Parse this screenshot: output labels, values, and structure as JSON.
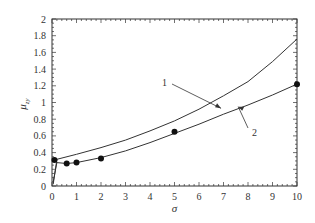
{
  "chart_data": {
    "type": "line",
    "title": "",
    "xlabel": "σ",
    "ylabel": "μ",
    "ylabel_sub": "zy",
    "xlim": [
      0,
      10
    ],
    "ylim": [
      0,
      2
    ],
    "grid": false,
    "x_ticks": [
      "0",
      "1",
      "2",
      "3",
      "4",
      "5",
      "6",
      "7",
      "8",
      "9",
      "10"
    ],
    "y_ticks": [
      "0",
      "0.2",
      "0.4",
      "0.6",
      "0.8",
      "1",
      "1.2",
      "1.4",
      "1.6",
      "1.8",
      "2"
    ],
    "series": [
      {
        "name": "1",
        "style": "line",
        "x": [
          0.05,
          0.2,
          1,
          2,
          3,
          4,
          5,
          6,
          7,
          8,
          9,
          10
        ],
        "values": [
          0.02,
          0.32,
          0.38,
          0.46,
          0.55,
          0.66,
          0.78,
          0.92,
          1.08,
          1.25,
          1.49,
          1.76
        ]
      },
      {
        "name": "2",
        "style": "line",
        "x": [
          0.05,
          0.2,
          0.6,
          1,
          2,
          3,
          4,
          5,
          6,
          7,
          8,
          9,
          10
        ],
        "values": [
          0.05,
          0.28,
          0.27,
          0.28,
          0.34,
          0.42,
          0.52,
          0.63,
          0.74,
          0.86,
          0.97,
          1.09,
          1.22
        ]
      },
      {
        "name": "experimental points",
        "style": "scatter",
        "x": [
          0.1,
          0.6,
          1,
          2,
          5,
          10
        ],
        "values": [
          0.31,
          0.27,
          0.28,
          0.33,
          0.65,
          1.22
        ]
      }
    ],
    "annotations": [
      {
        "text": "1",
        "points_to": [
          6.9,
          0.93
        ]
      },
      {
        "text": "2",
        "points_to": [
          7.6,
          0.95
        ]
      }
    ]
  }
}
